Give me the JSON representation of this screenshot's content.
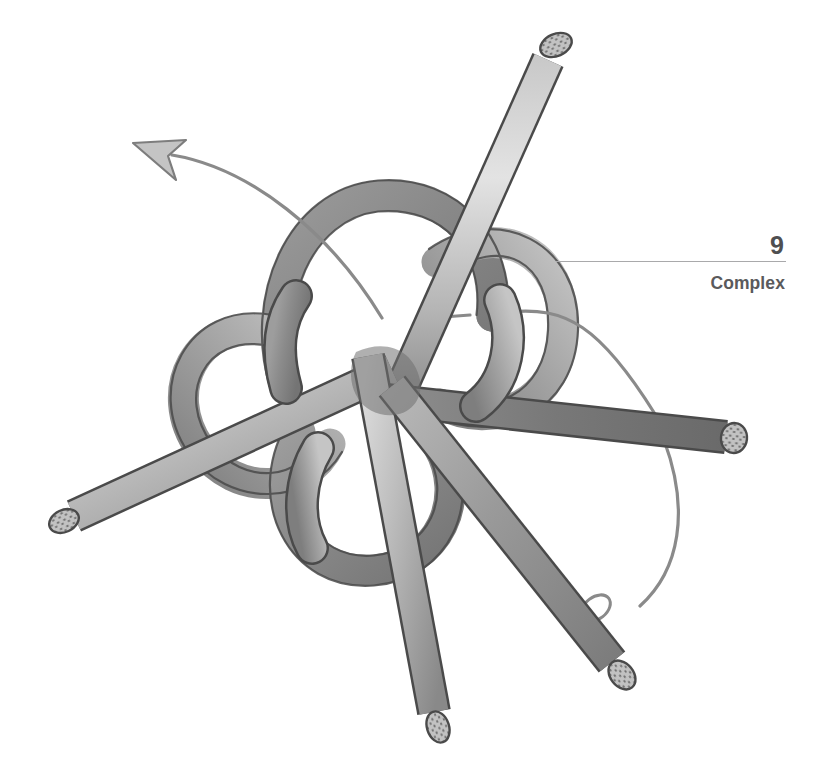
{
  "page": {
    "background_color": "#ffffff",
    "width": 821,
    "height": 782
  },
  "header": {
    "page_number": "9",
    "section_label": "Complex",
    "rule_color": "#a9a9ab",
    "text_color": "#58585a"
  },
  "figure": {
    "name": "complex-knot-illustration",
    "rope": {
      "color_light": "#d8d8d8",
      "color_mid": "#a7a7a7",
      "color_dark": "#6f6f6f",
      "outline_color": "#4a4a4a",
      "width_px": 30
    },
    "arrow": {
      "name": "direction-arrow",
      "color": "#8a8a8a",
      "points": "up-left"
    },
    "guide_line": {
      "name": "working-end-guide-line",
      "color": "#8a8a8a"
    },
    "rope_ends": [
      {
        "name": "rope-end-top",
        "x": 556,
        "y": 45
      },
      {
        "name": "rope-end-left",
        "x": 62,
        "y": 522
      },
      {
        "name": "rope-end-right",
        "x": 735,
        "y": 437
      },
      {
        "name": "rope-end-bottom-left",
        "x": 440,
        "y": 725
      },
      {
        "name": "rope-end-bottom-right",
        "x": 623,
        "y": 678
      }
    ]
  }
}
